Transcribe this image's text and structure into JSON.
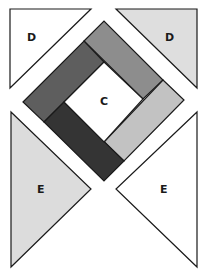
{
  "diagram": {
    "type": "quilt-block-pattern",
    "pieces": [
      {
        "id": "tl",
        "label": "D",
        "fill": "#ffffff",
        "points": "10,9 91,9 10,88",
        "label_pos": [
          27,
          32
        ]
      },
      {
        "id": "tr",
        "label": "D",
        "fill": "#dedede",
        "points": "116,9 197,9 197,88",
        "label_pos": [
          165,
          32
        ]
      },
      {
        "id": "strip-top",
        "label": "",
        "fill": "#8d8d8d",
        "points": "84,41 104,21 163,80 143,99"
      },
      {
        "id": "strip-right",
        "label": "",
        "fill": "#c2c2c2",
        "points": "163,80 184,100 124,161 104,142"
      },
      {
        "id": "strip-left",
        "label": "",
        "fill": "#5e5e5e",
        "points": "23,102 84,41 104,62 44,122"
      },
      {
        "id": "strip-bottom",
        "label": "",
        "fill": "#343434",
        "points": "44,122 64,102 124,161 104,181"
      },
      {
        "id": "center",
        "label": "C",
        "fill": "#ffffff",
        "points": "104,62 143,99 104,142 64,102",
        "label_pos": [
          100,
          96
        ]
      },
      {
        "id": "bl",
        "label": "E",
        "fill": "#dcdcdc",
        "points": "11,112 91,189 11,267",
        "label_pos": [
          37,
          184
        ]
      },
      {
        "id": "br",
        "label": "E",
        "fill": "#ffffff",
        "points": "197,112 116,189 197,267",
        "label_pos": [
          160,
          184
        ]
      }
    ],
    "stroke": "#1a1a1a"
  }
}
